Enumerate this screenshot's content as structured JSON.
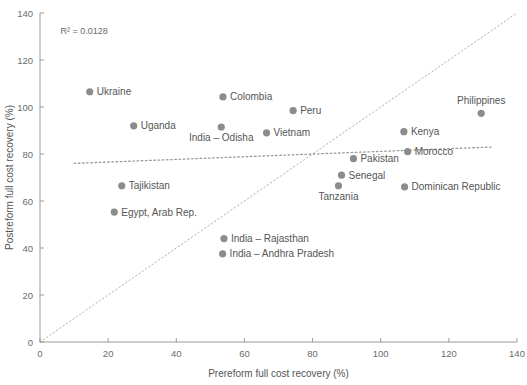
{
  "chart_data": {
    "type": "scatter",
    "title": "",
    "xlabel": "Prereform full cost recovery (%)",
    "ylabel": "Postreform full cost recovery (%)",
    "xlim": [
      0,
      140
    ],
    "ylim": [
      0,
      140
    ],
    "xticks": [
      0,
      20,
      40,
      60,
      80,
      100,
      120,
      140
    ],
    "yticks": [
      0,
      20,
      40,
      60,
      80,
      100,
      120,
      140
    ],
    "grid": false,
    "legend": "none",
    "annotations": [
      {
        "text": "R² = 0.0128",
        "x": 6,
        "y": 131
      }
    ],
    "reference_line": {
      "name": "45-degree-line",
      "style": "dotted",
      "from": [
        0,
        0
      ],
      "to": [
        140,
        140
      ]
    },
    "trendline": {
      "name": "linear-fit",
      "style": "dotted",
      "from": [
        10,
        76
      ],
      "to": [
        133,
        83
      ],
      "r_squared": 0.0128
    },
    "points": [
      {
        "label": "Ukraine",
        "x": 14.6,
        "y": 106.5,
        "label_pos": "right"
      },
      {
        "label": "Colombia",
        "x": 53.7,
        "y": 104.3,
        "label_pos": "right"
      },
      {
        "label": "Peru",
        "x": 74.3,
        "y": 98.5,
        "label_pos": "right"
      },
      {
        "label": "Philippines",
        "x": 129.5,
        "y": 97.3,
        "label_pos": "above"
      },
      {
        "label": "Uganda",
        "x": 27.5,
        "y": 92.0,
        "label_pos": "right"
      },
      {
        "label": "India – Odisha",
        "x": 53.2,
        "y": 91.5,
        "label_pos": "below"
      },
      {
        "label": "Vietnam",
        "x": 66.5,
        "y": 89.0,
        "label_pos": "right"
      },
      {
        "label": "Kenya",
        "x": 106.8,
        "y": 89.5,
        "label_pos": "right"
      },
      {
        "label": "Morocco",
        "x": 107.9,
        "y": 81.0,
        "label_pos": "right"
      },
      {
        "label": "Pakistan",
        "x": 92.0,
        "y": 78.0,
        "label_pos": "right"
      },
      {
        "label": "Senegal",
        "x": 88.5,
        "y": 71.0,
        "label_pos": "right"
      },
      {
        "label": "Tanzania",
        "x": 87.6,
        "y": 66.5,
        "label_pos": "below"
      },
      {
        "label": "Dominican Republic",
        "x": 107.0,
        "y": 66.0,
        "label_pos": "right"
      },
      {
        "label": "Tajikistan",
        "x": 24.0,
        "y": 66.5,
        "label_pos": "right"
      },
      {
        "label": "Egypt, Arab Rep.",
        "x": 21.8,
        "y": 55.3,
        "label_pos": "right"
      },
      {
        "label": "India – Rajasthan",
        "x": 54.0,
        "y": 44.0,
        "label_pos": "right"
      },
      {
        "label": "India – Andhra Pradesh",
        "x": 53.6,
        "y": 37.5,
        "label_pos": "right"
      }
    ]
  },
  "colors": {
    "marker": "#8c8c8c",
    "axis": "#9a9a9a",
    "text": "#555555",
    "trendline": "#9a9a9a",
    "reference_line": "#b0b0b0"
  }
}
